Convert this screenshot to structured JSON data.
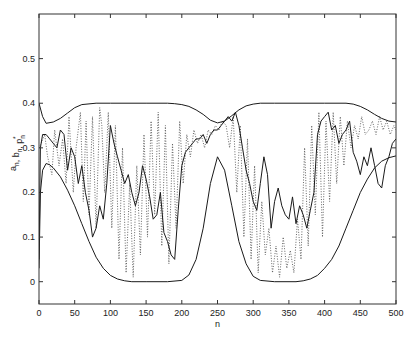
{
  "chart_data": {
    "type": "line",
    "title": "",
    "xlabel": "n",
    "ylabel": "a_n, b_n, p_n*",
    "xlim": [
      0,
      500
    ],
    "ylim": [
      -0.05,
      0.6
    ],
    "grid": false,
    "legend": null,
    "xticks": [
      0,
      50,
      100,
      150,
      200,
      250,
      300,
      350,
      400,
      450,
      500
    ],
    "yticks": [
      0,
      0.1,
      0.2,
      0.3,
      0.4,
      0.5
    ],
    "xtick_labels": [
      "0",
      "50",
      "100",
      "150",
      "200",
      "250",
      "300",
      "350",
      "400",
      "450",
      "500"
    ],
    "ytick_labels": [
      "0",
      "0.1",
      "0.2",
      "0.3",
      "0.4",
      "0.5"
    ],
    "series": [
      {
        "name": "upper bound b_n",
        "style": "solid",
        "x": [
          0,
          5,
          10,
          20,
          30,
          40,
          50,
          60,
          80,
          100,
          150,
          180,
          190,
          200,
          210,
          220,
          230,
          240,
          250,
          260,
          270,
          280,
          290,
          300,
          310,
          330,
          400,
          430,
          440,
          450,
          460,
          470,
          480,
          490,
          500
        ],
        "values": [
          0.4,
          0.37,
          0.355,
          0.358,
          0.366,
          0.378,
          0.39,
          0.397,
          0.4,
          0.4,
          0.4,
          0.4,
          0.399,
          0.397,
          0.393,
          0.385,
          0.375,
          0.362,
          0.356,
          0.36,
          0.372,
          0.385,
          0.394,
          0.398,
          0.4,
          0.4,
          0.4,
          0.4,
          0.398,
          0.393,
          0.385,
          0.375,
          0.366,
          0.36,
          0.358
        ]
      },
      {
        "name": "lower bound a_n",
        "style": "solid",
        "x": [
          0,
          2,
          5,
          10,
          15,
          20,
          30,
          40,
          50,
          60,
          70,
          80,
          90,
          100,
          110,
          120,
          130,
          150,
          180,
          200,
          210,
          220,
          230,
          240,
          250,
          260,
          270,
          280,
          290,
          300,
          310,
          330,
          360,
          370,
          380,
          390,
          400,
          410,
          420,
          430,
          440,
          450,
          460,
          470,
          480,
          490,
          500
        ],
        "values": [
          0.03,
          0.2,
          0.25,
          0.265,
          0.262,
          0.255,
          0.235,
          0.205,
          0.17,
          0.13,
          0.09,
          0.055,
          0.03,
          0.014,
          0.006,
          0.002,
          0.0,
          0.0,
          0.0,
          0.003,
          0.015,
          0.05,
          0.12,
          0.22,
          0.28,
          0.25,
          0.17,
          0.09,
          0.04,
          0.012,
          0.003,
          0.0,
          0.0,
          0.002,
          0.006,
          0.014,
          0.03,
          0.05,
          0.08,
          0.12,
          0.16,
          0.2,
          0.23,
          0.255,
          0.27,
          0.278,
          0.282
        ]
      },
      {
        "name": "a_n (sample path)",
        "style": "solid",
        "x": [
          0,
          2,
          5,
          10,
          15,
          20,
          25,
          30,
          35,
          40,
          45,
          50,
          55,
          60,
          65,
          70,
          75,
          80,
          85,
          90,
          95,
          100,
          105,
          110,
          115,
          120,
          125,
          130,
          135,
          140,
          145,
          150,
          155,
          160,
          165,
          170,
          175,
          180,
          185,
          190,
          195,
          200,
          205,
          210,
          215,
          220,
          225,
          230,
          235,
          240,
          245,
          250,
          255,
          260,
          265,
          270,
          275,
          280,
          285,
          290,
          295,
          300,
          305,
          310,
          315,
          320,
          325,
          330,
          335,
          340,
          345,
          350,
          355,
          360,
          365,
          370,
          375,
          380,
          385,
          390,
          395,
          400,
          405,
          410,
          415,
          420,
          425,
          430,
          435,
          440,
          445,
          450,
          455,
          460,
          465,
          470,
          475,
          480,
          485,
          490,
          495,
          500
        ],
        "values": [
          0.05,
          0.3,
          0.33,
          0.33,
          0.32,
          0.31,
          0.3,
          0.34,
          0.33,
          0.25,
          0.3,
          0.28,
          0.22,
          0.26,
          0.2,
          0.16,
          0.1,
          0.12,
          0.17,
          0.14,
          0.22,
          0.35,
          0.31,
          0.28,
          0.25,
          0.22,
          0.24,
          0.2,
          0.17,
          0.2,
          0.26,
          0.23,
          0.19,
          0.14,
          0.15,
          0.2,
          0.11,
          0.09,
          0.06,
          0.05,
          0.16,
          0.26,
          0.29,
          0.3,
          0.31,
          0.32,
          0.32,
          0.33,
          0.31,
          0.33,
          0.34,
          0.34,
          0.35,
          0.36,
          0.37,
          0.36,
          0.38,
          0.35,
          0.3,
          0.25,
          0.22,
          0.18,
          0.16,
          0.22,
          0.28,
          0.24,
          0.12,
          0.18,
          0.21,
          0.17,
          0.15,
          0.14,
          0.19,
          0.13,
          0.17,
          0.15,
          0.12,
          0.16,
          0.2,
          0.33,
          0.36,
          0.37,
          0.38,
          0.34,
          0.35,
          0.31,
          0.33,
          0.34,
          0.36,
          0.29,
          0.27,
          0.24,
          0.28,
          0.26,
          0.3,
          0.26,
          0.22,
          0.21,
          0.26,
          0.28,
          0.31,
          0.32
        ]
      },
      {
        "name": "p_n* (sample path)",
        "style": "dotted",
        "x": [
          0,
          3,
          8,
          12,
          18,
          22,
          28,
          33,
          38,
          42,
          48,
          52,
          58,
          62,
          66,
          70,
          75,
          80,
          85,
          88,
          92,
          97,
          102,
          107,
          112,
          117,
          122,
          127,
          132,
          137,
          142,
          147,
          152,
          157,
          162,
          167,
          172,
          177,
          182,
          187,
          192,
          197,
          202,
          207,
          212,
          217,
          222,
          227,
          232,
          237,
          242,
          247,
          252,
          257,
          262,
          267,
          272,
          277,
          282,
          287,
          292,
          297,
          302,
          307,
          312,
          317,
          322,
          327,
          332,
          337,
          342,
          347,
          352,
          357,
          362,
          367,
          372,
          377,
          382,
          387,
          392,
          397,
          402,
          407,
          412,
          417,
          422,
          427,
          432,
          437,
          442,
          447,
          452,
          457,
          462,
          467,
          472,
          477,
          482,
          487,
          492,
          497,
          500
        ],
        "values": [
          0.3,
          0.31,
          0.33,
          0.28,
          0.24,
          0.34,
          0.26,
          0.32,
          0.22,
          0.37,
          0.2,
          0.3,
          0.38,
          0.18,
          0.36,
          0.15,
          0.37,
          0.12,
          0.39,
          0.35,
          0.2,
          0.38,
          0.12,
          0.35,
          0.05,
          0.3,
          0.02,
          0.22,
          0.01,
          0.26,
          0.06,
          0.33,
          0.1,
          0.36,
          0.15,
          0.38,
          0.08,
          0.35,
          0.04,
          0.31,
          0.12,
          0.36,
          0.22,
          0.33,
          0.28,
          0.34,
          0.31,
          0.33,
          0.3,
          0.34,
          0.33,
          0.35,
          0.34,
          0.36,
          0.35,
          0.3,
          0.37,
          0.2,
          0.35,
          0.1,
          0.32,
          0.05,
          0.26,
          0.02,
          0.18,
          0.06,
          0.12,
          0.02,
          0.08,
          0.01,
          0.1,
          0.03,
          0.07,
          0.02,
          0.14,
          0.05,
          0.3,
          0.08,
          0.35,
          0.15,
          0.38,
          0.1,
          0.36,
          0.18,
          0.38,
          0.22,
          0.37,
          0.26,
          0.36,
          0.3,
          0.35,
          0.32,
          0.37,
          0.33,
          0.34,
          0.36,
          0.33,
          0.37,
          0.34,
          0.36,
          0.33,
          0.35,
          0.34
        ]
      }
    ]
  },
  "axes": {
    "xlabel": "n",
    "ylabel_main": "a",
    "ylabel_parts": [
      {
        "base": "a",
        "sub": "n",
        "sup": ""
      },
      {
        "base": ", b",
        "sub": "n",
        "sup": ""
      },
      {
        "base": ", p",
        "sub": "n",
        "sup": "*"
      }
    ]
  },
  "colors": {
    "line": "#1a1a1a",
    "dotted": "#555555",
    "axis": "#333333",
    "background": "#ffffff"
  }
}
